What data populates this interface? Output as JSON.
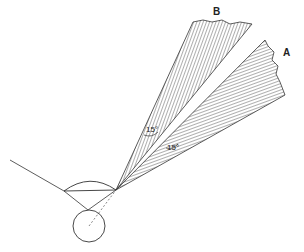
{
  "diagram": {
    "type": "optics-field-of-view",
    "labels": {
      "beam_b": "B",
      "beam_a": "A",
      "angle_b": "15°",
      "angle_a": "15°"
    },
    "colors": {
      "line": "#333333",
      "hatch": "#333333",
      "background": "#ffffff"
    }
  }
}
